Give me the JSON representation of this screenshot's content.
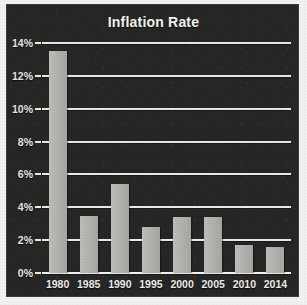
{
  "chart_data": {
    "type": "bar",
    "title": "Inflation Rate",
    "xlabel": "",
    "ylabel": "",
    "categories": [
      "1980",
      "1985",
      "1990",
      "1995",
      "2000",
      "2005",
      "2010",
      "2014"
    ],
    "values": [
      13.5,
      3.5,
      5.4,
      2.8,
      3.4,
      3.4,
      1.7,
      1.6
    ],
    "ylim": [
      0,
      14
    ],
    "ytick_values": [
      0,
      2,
      4,
      6,
      8,
      10,
      12,
      14
    ],
    "ytick_labels": [
      "0%",
      "2%",
      "4%",
      "6%",
      "8%",
      "10%",
      "12%",
      "14%"
    ],
    "grid": true,
    "legend": null,
    "legend_position": "none",
    "colors": {
      "background": "#262625",
      "bar": "#b2b2ae",
      "gridline": "#e9e9e6",
      "text": "#f0f0ed",
      "page": "#f2f2f0"
    }
  }
}
